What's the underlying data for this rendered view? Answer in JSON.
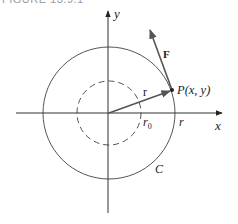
{
  "caption": "FIGURE 13.9.1",
  "axes": {
    "x_label": "x",
    "y_label": "y"
  },
  "labels": {
    "point": "P(x, y)",
    "force": "F",
    "radius_vector": "r",
    "r0": "r",
    "r0_sub": "0",
    "r_on_axis": "r",
    "curve": "C"
  },
  "colors": {
    "axis": "#333333",
    "circle": "#555555",
    "vector": "#555555",
    "text": "#222222"
  },
  "geometry": {
    "origin": [
      109,
      113
    ],
    "outer_circle_radius": 66,
    "inner_dashed_circle_radius": 32,
    "point_P": [
      172,
      90
    ],
    "force_tip": [
      149,
      28
    ]
  }
}
